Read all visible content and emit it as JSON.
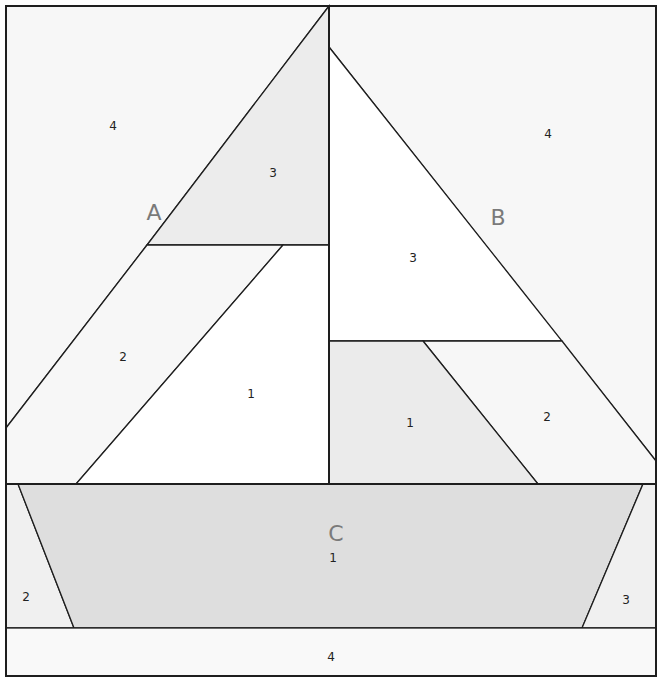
{
  "diagram": {
    "type": "quilt-block-pattern",
    "sections": [
      {
        "id": "A",
        "label": "A",
        "pieces": [
          {
            "number": "1",
            "fill": "#ffffff"
          },
          {
            "number": "2",
            "fill": "#f7f7f7"
          },
          {
            "number": "3",
            "fill": "#ececec"
          },
          {
            "number": "4",
            "fill": "#f7f7f7"
          }
        ]
      },
      {
        "id": "B",
        "label": "B",
        "pieces": [
          {
            "number": "1",
            "fill": "#ebebeb"
          },
          {
            "number": "2",
            "fill": "#f7f7f7"
          },
          {
            "number": "3",
            "fill": "#ffffff"
          },
          {
            "number": "4",
            "fill": "#f7f7f7"
          }
        ]
      },
      {
        "id": "C",
        "label": "C",
        "pieces": [
          {
            "number": "1",
            "fill": "#dedede"
          },
          {
            "number": "2",
            "fill": "#f0f0f0"
          },
          {
            "number": "3",
            "fill": "#f0f0f0"
          },
          {
            "number": "4",
            "fill": "#f9f9f9"
          }
        ]
      }
    ],
    "colors": {
      "outline": "#1e1e1e",
      "section_label": "#7a7a7a",
      "piece_number": "#222222"
    }
  }
}
